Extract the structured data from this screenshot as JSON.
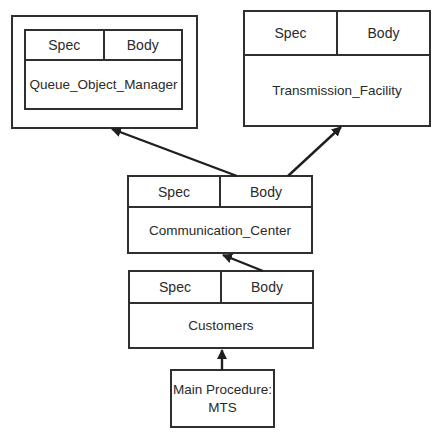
{
  "diagram": {
    "type": "package-dependency",
    "nodes": [
      {
        "id": "queue_object_manager",
        "spec_label": "Spec",
        "body_label": "Body",
        "name": "Queue_Object_Manager",
        "enclosed_in_outer_frame": true
      },
      {
        "id": "transmission_facility",
        "spec_label": "Spec",
        "body_label": "Body",
        "name": "Transmission_Facility"
      },
      {
        "id": "communication_center",
        "spec_label": "Spec",
        "body_label": "Body",
        "name": "Communication_Center"
      },
      {
        "id": "customers",
        "spec_label": "Spec",
        "body_label": "Body",
        "name": "Customers"
      },
      {
        "id": "main_procedure",
        "line1": "Main Procedure:",
        "line2": "MTS"
      }
    ],
    "edges": [
      {
        "from": "communication_center",
        "to": "queue_object_manager"
      },
      {
        "from": "communication_center",
        "to": "transmission_facility"
      },
      {
        "from": "customers",
        "to": "communication_center"
      },
      {
        "from": "main_procedure",
        "to": "customers"
      }
    ],
    "colors": {
      "stroke": "#2f2f2f",
      "background": "#ffffff",
      "text": "#2a2a2a"
    }
  }
}
